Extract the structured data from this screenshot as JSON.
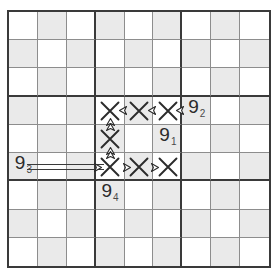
{
  "diagram": {
    "type": "sudoku-grid",
    "grid_size": 9,
    "box_size": 3,
    "colors": {
      "shaded_cell": "#eaeaea",
      "empty_cell": "#ffffff",
      "thick_line": "#3a3a3a",
      "thin_line": "#8d8d8d",
      "ink": "#2b2b2b"
    },
    "shaded_cells": [
      [
        1,
        2
      ],
      [
        1,
        4
      ],
      [
        1,
        6
      ],
      [
        1,
        8
      ],
      [
        2,
        1
      ],
      [
        2,
        3
      ],
      [
        2,
        5
      ],
      [
        2,
        7
      ],
      [
        2,
        9
      ],
      [
        3,
        2
      ],
      [
        3,
        4
      ],
      [
        3,
        6
      ],
      [
        3,
        8
      ],
      [
        4,
        1
      ],
      [
        4,
        3
      ],
      [
        4,
        5
      ],
      [
        4,
        7
      ],
      [
        4,
        9
      ],
      [
        5,
        2
      ],
      [
        5,
        4
      ],
      [
        5,
        6
      ],
      [
        5,
        8
      ],
      [
        6,
        1
      ],
      [
        6,
        3
      ],
      [
        6,
        5
      ],
      [
        6,
        7
      ],
      [
        6,
        9
      ],
      [
        7,
        2
      ],
      [
        7,
        4
      ],
      [
        7,
        6
      ],
      [
        7,
        8
      ],
      [
        8,
        1
      ],
      [
        8,
        3
      ],
      [
        8,
        5
      ],
      [
        8,
        7
      ],
      [
        8,
        9
      ],
      [
        9,
        2
      ],
      [
        9,
        4
      ],
      [
        9,
        6
      ],
      [
        9,
        8
      ]
    ],
    "labels": [
      {
        "id": "label-9-1",
        "digit": "9",
        "subscript": "1",
        "row": 5,
        "col": 6
      },
      {
        "id": "label-9-2",
        "digit": "9",
        "subscript": "2",
        "row": 4,
        "col": 7
      },
      {
        "id": "label-9-3",
        "digit": "9",
        "subscript": "3",
        "row": 6,
        "col": 1
      },
      {
        "id": "label-9-4",
        "digit": "9",
        "subscript": "4",
        "row": 7,
        "col": 4
      }
    ],
    "eliminations": [
      {
        "id": "x-r4c4",
        "row": 4,
        "col": 4
      },
      {
        "id": "x-r4c5",
        "row": 4,
        "col": 5
      },
      {
        "id": "x-r4c6",
        "row": 4,
        "col": 6
      },
      {
        "id": "x-r5c4",
        "row": 5,
        "col": 4
      },
      {
        "id": "x-r6c4",
        "row": 6,
        "col": 4
      },
      {
        "id": "x-r6c5",
        "row": 6,
        "col": 5
      },
      {
        "id": "x-r6c6",
        "row": 6,
        "col": 6
      }
    ],
    "link_arrows": [
      {
        "id": "arrow-r4c4-right",
        "row": 4,
        "col": 4,
        "direction": "left",
        "position": "right"
      },
      {
        "id": "arrow-r4c4-below",
        "row": 4,
        "col": 4,
        "direction": "up",
        "position": "bottom"
      },
      {
        "id": "arrow-r4c5-right",
        "row": 4,
        "col": 5,
        "direction": "left",
        "position": "right"
      },
      {
        "id": "arrow-r4c6-right",
        "row": 4,
        "col": 6,
        "direction": "left",
        "position": "right"
      },
      {
        "id": "arrow-r5c4-above",
        "row": 5,
        "col": 4,
        "direction": "up",
        "position": "top"
      },
      {
        "id": "arrow-r5c4-below",
        "row": 5,
        "col": 4,
        "direction": "up",
        "position": "bottom"
      },
      {
        "id": "arrow-r6c4-left",
        "row": 6,
        "col": 4,
        "direction": "right",
        "position": "left"
      },
      {
        "id": "arrow-r6c4-above",
        "row": 6,
        "col": 4,
        "direction": "up",
        "position": "top"
      },
      {
        "id": "arrow-r6c5-left",
        "row": 6,
        "col": 5,
        "direction": "right",
        "position": "left"
      },
      {
        "id": "arrow-r6c6-left",
        "row": 6,
        "col": 6,
        "direction": "right",
        "position": "left"
      }
    ],
    "strong_links": [
      {
        "id": "strong-link-9-3",
        "row": 6,
        "from_col": 1,
        "to_col": 4,
        "style": "double-line"
      }
    ]
  }
}
